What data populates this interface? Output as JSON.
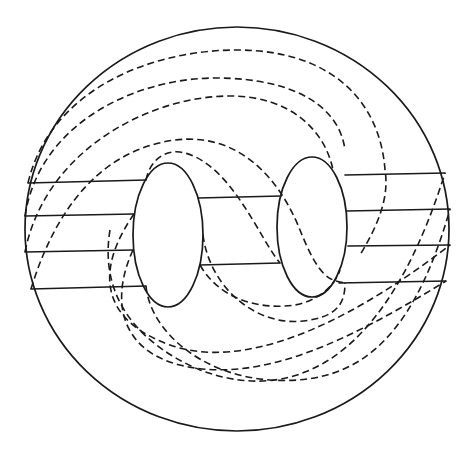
{
  "diagram": {
    "title": "",
    "stroke_color": "#1a1a1a",
    "background": "#ffffff",
    "outer_boundary": {
      "cx": 237,
      "cy": 229,
      "rx": 212,
      "ry": 202
    },
    "holes": [
      {
        "name": "left-hole",
        "cx": 168,
        "cy": 235,
        "rx": 35,
        "ry": 72
      },
      {
        "name": "right-hole",
        "cx": 312,
        "cy": 227,
        "rx": 35,
        "ry": 70
      }
    ],
    "solid_segments": [
      {
        "x1": 28,
        "y1": 183,
        "x2": 146,
        "y2": 180
      },
      {
        "x1": 25,
        "y1": 216,
        "x2": 134,
        "y2": 214
      },
      {
        "x1": 25,
        "y1": 252,
        "x2": 133,
        "y2": 250
      },
      {
        "x1": 31,
        "y1": 289,
        "x2": 146,
        "y2": 286
      },
      {
        "x1": 198,
        "y1": 198,
        "x2": 281,
        "y2": 196
      },
      {
        "x1": 200,
        "y1": 265,
        "x2": 280,
        "y2": 263
      },
      {
        "x1": 345,
        "y1": 175,
        "x2": 445,
        "y2": 173
      },
      {
        "x1": 347,
        "y1": 211,
        "x2": 450,
        "y2": 209
      },
      {
        "x1": 348,
        "y1": 246,
        "x2": 450,
        "y2": 245
      },
      {
        "x1": 339,
        "y1": 283,
        "x2": 446,
        "y2": 281
      }
    ],
    "dashed_curves": [
      "M 28 183 C 50 90 150 50 237 50 C 330 50 380 100 385 170 C 390 200 375 230 360 255",
      "M 25 216 C 40 120 140 78 215 78 C 300 78 340 110 345 150",
      "M 25 252 C 45 150 150 96 230 96 C 290 96 325 130 333 170",
      "M 31 289 C 55 210 100 150 175 140 C 240 132 280 180 300 230 C 320 280 330 280 345 283",
      "M 146 180 C 150 160 165 150 180 152 C 230 160 260 240 280 263",
      "M 133 250 C 110 300 120 350 180 365 C 260 385 350 340 446 281",
      "M 134 214 C 95 270 100 320 170 345 C 240 370 340 330 450 245",
      "M 146 286 C 150 330 200 375 270 380 C 350 385 410 350 450 209",
      "M 203 235 C 210 290 260 330 310 320 C 340 315 345 300 345 283",
      "M 200 265 C 220 300 260 310 295 305 C 320 300 335 285 340 270",
      "M 110 230 C 100 290 130 340 200 370 C 280 400 380 380 445 173"
    ]
  }
}
